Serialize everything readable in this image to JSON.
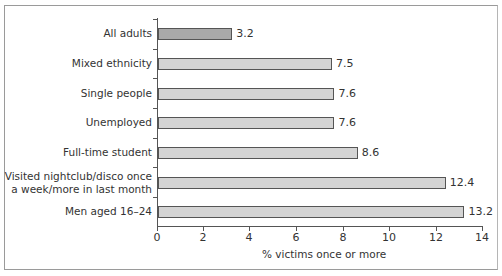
{
  "chart_data": {
    "type": "bar",
    "orientation": "horizontal",
    "title": "",
    "xlabel": "% victims once or more",
    "ylabel": "",
    "xlim": [
      0,
      14
    ],
    "xticks": [
      "0",
      "2",
      "4",
      "6",
      "8",
      "10",
      "12",
      "14"
    ],
    "grid": false,
    "legend": null,
    "categories": [
      "All adults",
      "Mixed ethnicity",
      "Single people",
      "Unemployed",
      "Full-time student",
      "Visited nightclub/disco once a week/more in last month",
      "Men aged 16–24"
    ],
    "category_lines": [
      [
        "All adults"
      ],
      [
        "Mixed ethnicity"
      ],
      [
        "Single people"
      ],
      [
        "Unemployed"
      ],
      [
        "Full-time student"
      ],
      [
        "Visited nightclub/disco once",
        "a week/more in last month"
      ],
      [
        "Men aged 16–24"
      ]
    ],
    "values": [
      3.2,
      7.5,
      7.6,
      7.6,
      8.6,
      12.4,
      13.2
    ],
    "value_labels": [
      "3.2",
      "7.5",
      "7.6",
      "7.6",
      "8.6",
      "12.4",
      "13.2"
    ],
    "colors": {
      "highlight": "#a9a9a9",
      "default": "#d4d4d4",
      "outline": "#555555"
    }
  }
}
